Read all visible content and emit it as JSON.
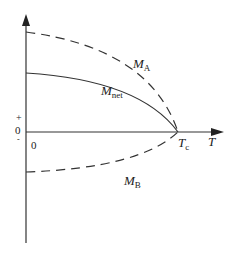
{
  "diagram": {
    "type": "magnetization-vs-temperature",
    "axes": {
      "x_label": "T",
      "y_plus_sign": "+",
      "y_zero_label": "0",
      "y_minus_sign": "-",
      "origin_label": "0",
      "critical_temp_label": "T",
      "critical_temp_subscript": "c"
    },
    "curves": [
      {
        "name": "M_A",
        "label_main": "M",
        "label_sub": "A",
        "style": "dashed",
        "color": "#333333"
      },
      {
        "name": "M_net",
        "label_main": "M",
        "label_sub": "net",
        "style": "solid",
        "color": "#333333"
      },
      {
        "name": "M_B",
        "label_main": "M",
        "label_sub": "B",
        "style": "dashed",
        "color": "#333333"
      }
    ]
  }
}
